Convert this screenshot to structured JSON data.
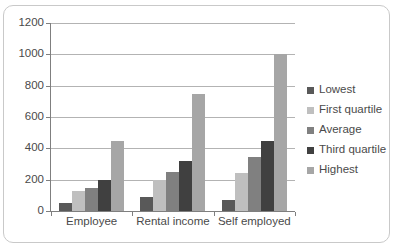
{
  "chart_data": {
    "type": "bar",
    "title": "",
    "xlabel": "",
    "ylabel": "",
    "categories": [
      "Employee",
      "Rental income",
      "Self employed"
    ],
    "series": [
      {
        "name": "Lowest",
        "color": "#595959",
        "values": [
          50,
          90,
          70
        ]
      },
      {
        "name": "First quartile",
        "color": "#bfbfbf",
        "values": [
          125,
          200,
          245
        ]
      },
      {
        "name": "Average",
        "color": "#808080",
        "values": [
          150,
          250,
          345
        ]
      },
      {
        "name": "Third quartile",
        "color": "#404040",
        "values": [
          200,
          320,
          445
        ]
      },
      {
        "name": "Highest",
        "color": "#a6a6a6",
        "values": [
          445,
          745,
          1000
        ]
      }
    ],
    "ylim": [
      0,
      1200
    ],
    "y_ticks": [
      0,
      200,
      400,
      600,
      800,
      1000,
      1200
    ],
    "y_tick_labels": [
      "0",
      "200",
      "400",
      "600",
      "800",
      "1000",
      "1200"
    ],
    "grid": true,
    "legend_position": "right"
  },
  "axes": {
    "y_labels": [
      "1200",
      "1000",
      "800",
      "600",
      "400",
      "200",
      "0"
    ],
    "x_labels": [
      "Employee",
      "Rental income",
      "Self employed"
    ]
  },
  "legend": {
    "items": [
      {
        "label": "Lowest",
        "color": "#595959"
      },
      {
        "label": "First quartile",
        "color": "#bfbfbf"
      },
      {
        "label": "Average",
        "color": "#808080"
      },
      {
        "label": "Third quartile",
        "color": "#404040"
      },
      {
        "label": "Highest",
        "color": "#a6a6a6"
      }
    ]
  }
}
